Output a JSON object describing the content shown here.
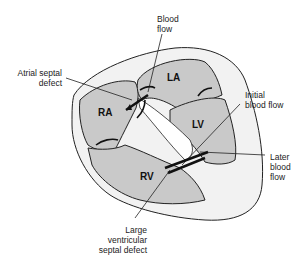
{
  "diagram": {
    "type": "anatomical",
    "colors": {
      "chamber_fill": "#c9c9c9",
      "outer_fill": "#f2f2f2",
      "outline": "#222222",
      "background": "#ffffff"
    },
    "chambers": {
      "ra": "RA",
      "la": "LA",
      "lv": "LV",
      "rv": "RV"
    },
    "labels": {
      "blood_flow": [
        "Blood",
        "flow"
      ],
      "atrial_septal_defect": [
        "Atrial septal",
        "defect"
      ],
      "initial_blood_flow": [
        "Initial",
        "blood flow"
      ],
      "later_blood_flow": [
        "Later",
        "blood",
        "flow"
      ],
      "large_vsd": [
        "Large ventricular",
        "septal defect"
      ]
    }
  }
}
